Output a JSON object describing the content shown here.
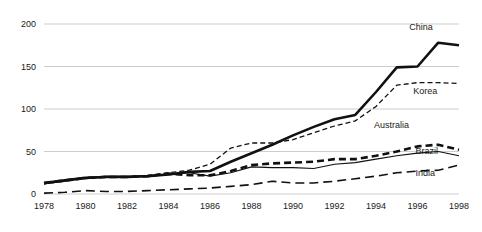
{
  "chart_data": {
    "type": "line",
    "title": "",
    "subtitle": "",
    "xlabel": "",
    "ylabel": "",
    "xlim": [
      1978,
      1998
    ],
    "ylim": [
      0,
      200
    ],
    "grid": true,
    "legend_position": "inline-right-of-line-ends",
    "x": [
      1978,
      1979,
      1980,
      1981,
      1982,
      1983,
      1984,
      1985,
      1986,
      1987,
      1988,
      1989,
      1990,
      1991,
      1992,
      1993,
      1994,
      1995,
      1996,
      1997,
      1998
    ],
    "y_ticks": [
      0,
      50,
      100,
      150,
      200
    ],
    "y_tick_labels": [
      "0",
      "50",
      "100",
      "150",
      "200"
    ],
    "x_ticks": [
      1978,
      1980,
      1982,
      1984,
      1986,
      1988,
      1990,
      1992,
      1994,
      1996,
      1998
    ],
    "x_tick_labels": [
      "1978",
      "1980",
      "1982",
      "1984",
      "1986",
      "1988",
      "1990",
      "1992",
      "1994",
      "1996",
      "1998"
    ],
    "series": [
      {
        "name": "China",
        "label": "China",
        "style": "solid-thick",
        "color": "#111111",
        "values": [
          13,
          16,
          19,
          20,
          20,
          21,
          23,
          26,
          27,
          38,
          48,
          58,
          69,
          79,
          88,
          93,
          120,
          149,
          150,
          178,
          175
        ]
      },
      {
        "name": "Korea",
        "label": "Korea",
        "style": "short-dash",
        "color": "#111111",
        "values": [
          12,
          15,
          18,
          20,
          20,
          22,
          25,
          28,
          35,
          54,
          60,
          60,
          64,
          72,
          80,
          86,
          103,
          128,
          131,
          131,
          130
        ]
      },
      {
        "name": "Australia",
        "label": "Australia",
        "style": "bold-dash",
        "color": "#111111",
        "values": [
          13,
          16,
          19,
          20,
          20,
          21,
          24,
          22,
          22,
          27,
          34,
          36,
          37,
          38,
          41,
          41,
          45,
          50,
          56,
          58,
          52
        ]
      },
      {
        "name": "Brazil",
        "label": "Brazil",
        "style": "thin-solid",
        "color": "#111111",
        "values": [
          12,
          15,
          19,
          21,
          21,
          21,
          23,
          25,
          21,
          25,
          32,
          31,
          31,
          30,
          35,
          37,
          41,
          45,
          48,
          50,
          45
        ]
      },
      {
        "name": "India",
        "label": "India",
        "style": "long-dash",
        "color": "#111111",
        "values": [
          1,
          2,
          4,
          3,
          3,
          4,
          5,
          6,
          7,
          9,
          11,
          15,
          13,
          13,
          15,
          18,
          21,
          25,
          27,
          28,
          34
        ]
      }
    ],
    "series_label_positions": [
      {
        "name": "China",
        "x": 1995.6,
        "y": 193
      },
      {
        "name": "Korea",
        "x": 1995.8,
        "y": 118
      },
      {
        "name": "Australia",
        "x": 1993.9,
        "y": 78
      },
      {
        "name": "Brazil",
        "x": 1995.9,
        "y": 47
      },
      {
        "name": "India",
        "x": 1995.9,
        "y": 21
      }
    ]
  }
}
